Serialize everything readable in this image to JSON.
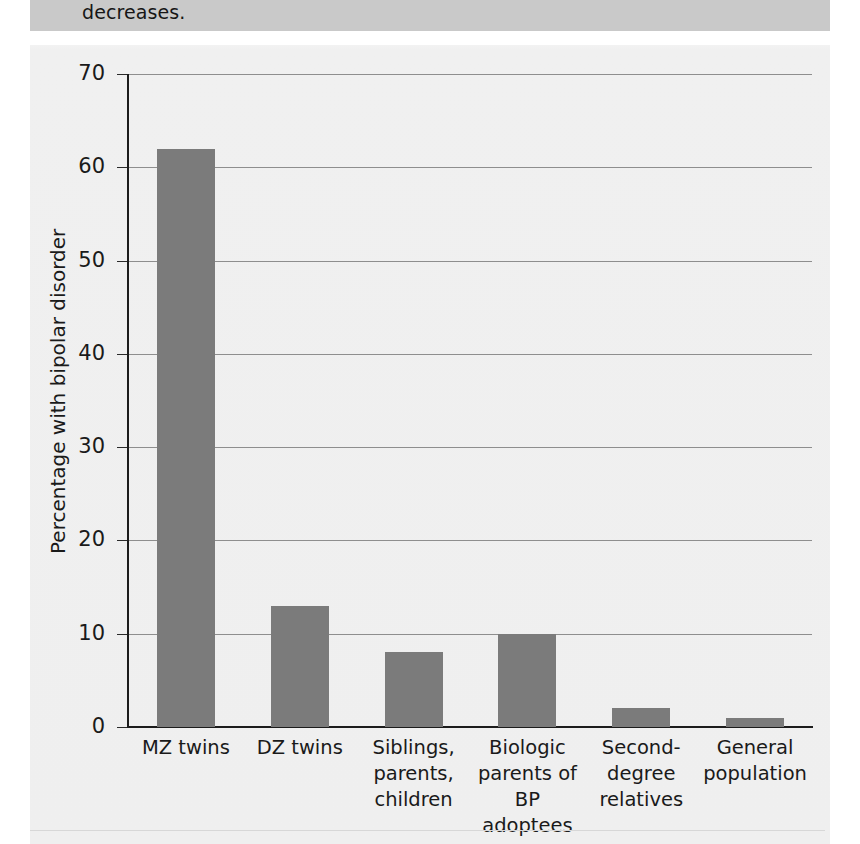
{
  "caption": {
    "text": "decreases."
  },
  "chart_data": {
    "type": "bar",
    "title": "",
    "xlabel": "",
    "ylabel": "Percentage with bipolar disorder",
    "ylim": [
      0,
      70
    ],
    "ytick_values": [
      0,
      10,
      20,
      30,
      40,
      50,
      60,
      70
    ],
    "ytick_labels": [
      "0",
      "10",
      "20",
      "30",
      "40",
      "50",
      "60",
      "70"
    ],
    "grid": true,
    "legend": "none",
    "bar_color": "#7b7b7b",
    "categories": [
      "MZ twins",
      "DZ twins",
      "Siblings,\nparents,\nchildren",
      "Biologic\nparents of\nBP adoptees",
      "Second-\ndegree\nrelatives",
      "General\npopulation"
    ],
    "category_lines": [
      [
        "MZ twins"
      ],
      [
        "DZ twins"
      ],
      [
        "Siblings,",
        "parents,",
        "children"
      ],
      [
        "Biologic",
        "parents of",
        "BP adoptees"
      ],
      [
        "Second-",
        "degree",
        "relatives"
      ],
      [
        "General",
        "population"
      ]
    ],
    "values": [
      62,
      13,
      8,
      10,
      2,
      1
    ]
  }
}
